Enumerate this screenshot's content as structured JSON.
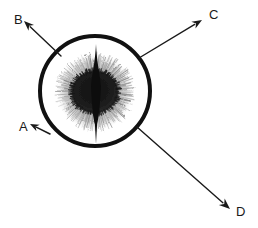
{
  "figure": {
    "type": "annotated-micrograph-schematic",
    "caption": "",
    "background_color": "#ffffff",
    "canvas": {
      "width": 258,
      "height": 228
    }
  },
  "colors": {
    "outline": "#111111",
    "core": "#1a1a1a",
    "halo": "#8c8c8c",
    "halo_light": "#b5b5b5",
    "spike": "#0d0d0d",
    "label": "#1a1a1a",
    "arrow": "#1a1a1a",
    "background": "#ffffff"
  },
  "circle": {
    "name": "outer-boundary-circle",
    "cx": 95,
    "cy": 91,
    "r": 55,
    "stroke_width": 4
  },
  "core": {
    "name": "dense-dark-core",
    "cx": 95,
    "cy": 92,
    "rx": 23,
    "ry": 21
  },
  "halo": {
    "name": "radial-fuzzy-halo",
    "cx": 95,
    "cy": 92,
    "rx": 38,
    "ry": 38,
    "ray_count": 220,
    "inner_fraction": 0.52
  },
  "spike": {
    "name": "vertical-axial-spike",
    "cx": 96,
    "top_y": 44,
    "bottom_y": 144,
    "max_half_width": 5
  },
  "labels": [
    {
      "id": "A",
      "text": "A",
      "x": 19,
      "y": 128
    },
    {
      "id": "B",
      "text": "B",
      "x": 14,
      "y": 21
    },
    {
      "id": "C",
      "text": "C",
      "x": 209,
      "y": 16
    },
    {
      "id": "D",
      "text": "D",
      "x": 236,
      "y": 213
    }
  ],
  "arrows": [
    {
      "id": "arrow-a",
      "label": "A",
      "from": {
        "x": 50,
        "y": 134
      },
      "to": {
        "x": 30,
        "y": 124
      },
      "points_to": "outer-boundary-circle",
      "stroke_width": 1.6,
      "head_size": 9
    },
    {
      "id": "arrow-b",
      "label": "B",
      "from": {
        "x": 61,
        "y": 56
      },
      "to": {
        "x": 24,
        "y": 21
      },
      "points_to": "outer-boundary-circle",
      "stroke_width": 1.4,
      "head_size": 10
    },
    {
      "id": "arrow-c",
      "label": "C",
      "from": {
        "x": 139,
        "y": 58
      },
      "to": {
        "x": 202,
        "y": 20
      },
      "points_to": "outer-boundary-circle",
      "stroke_width": 1.4,
      "head_size": 10
    },
    {
      "id": "arrow-d",
      "label": "D",
      "from": {
        "x": 137,
        "y": 127
      },
      "to": {
        "x": 230,
        "y": 209
      },
      "points_to": "outer-boundary-circle",
      "stroke_width": 1.4,
      "head_size": 11
    }
  ]
}
